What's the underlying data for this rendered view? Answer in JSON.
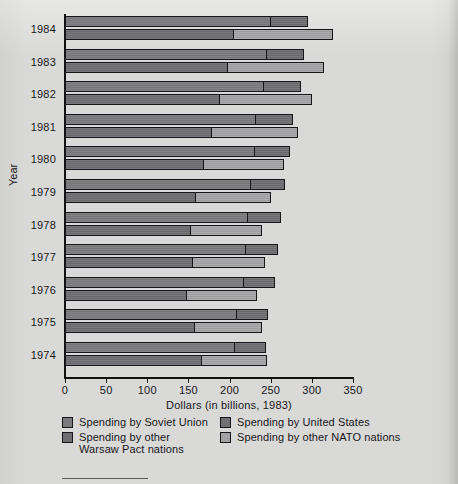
{
  "chart_data": {
    "type": "bar",
    "orientation": "horizontal",
    "title": "",
    "xlabel": "Dollars (in billions, 1983)",
    "ylabel": "Year",
    "xlim": [
      0,
      350
    ],
    "xticks": [
      0,
      50,
      100,
      150,
      200,
      250,
      300,
      350
    ],
    "xtick_labels": [
      "0",
      "50",
      "100",
      "150",
      "200",
      "250",
      "300",
      "350"
    ],
    "grid": false,
    "legend_position": "below-axis",
    "categories": [
      "1984",
      "1983",
      "1982",
      "1981",
      "1980",
      "1979",
      "1978",
      "1977",
      "1976",
      "1975",
      "1974"
    ],
    "series": [
      {
        "name": "Spending by Soviet Union",
        "color": "#7b7b7e",
        "group": "warsaw-pact",
        "values": [
          250,
          245,
          242,
          232,
          231,
          226,
          222,
          220,
          217,
          209,
          206
        ]
      },
      {
        "name": "Spending by other Warsaw Pact nations",
        "color": "#6e6e72",
        "group": "warsaw-pact",
        "values": [
          45,
          45,
          45,
          45,
          43,
          41,
          40,
          39,
          38,
          38,
          38
        ]
      },
      {
        "name": "Spending by United States",
        "color": "#717175",
        "group": "nato",
        "values": [
          205,
          197,
          188,
          178,
          168,
          158,
          152,
          155,
          147,
          157,
          166
        ]
      },
      {
        "name": "Spending by other NATO nations",
        "color": "#a2a2a4",
        "group": "nato",
        "values": [
          121,
          118,
          112,
          105,
          98,
          92,
          88,
          88,
          86,
          83,
          80
        ]
      }
    ],
    "group_totals": {
      "warsaw_pact": [
        295,
        290,
        287,
        277,
        274,
        267,
        262,
        259,
        255,
        247,
        244
      ],
      "nato": [
        326,
        315,
        300,
        283,
        266,
        250,
        240,
        243,
        233,
        240,
        246
      ]
    }
  },
  "axes": {
    "x_title": "Dollars (in billions, 1983)",
    "y_title": "Year",
    "ticks": [
      "0",
      "50",
      "100",
      "150",
      "200",
      "250",
      "300",
      "350"
    ],
    "years": [
      "1984",
      "1983",
      "1982",
      "1981",
      "1980",
      "1979",
      "1978",
      "1977",
      "1976",
      "1975",
      "1974"
    ]
  },
  "legend": {
    "items": [
      {
        "label": "Spending by Soviet Union",
        "color": "#7b7b7e",
        "column": "left"
      },
      {
        "label": "Spending by other\nWarsaw Pact nations",
        "color": "#6e6e72",
        "column": "left"
      },
      {
        "label": "Spending by United States",
        "color": "#717175",
        "column": "right"
      },
      {
        "label": "Spending by other NATO nations",
        "color": "#a2a2a4",
        "column": "right"
      }
    ]
  }
}
